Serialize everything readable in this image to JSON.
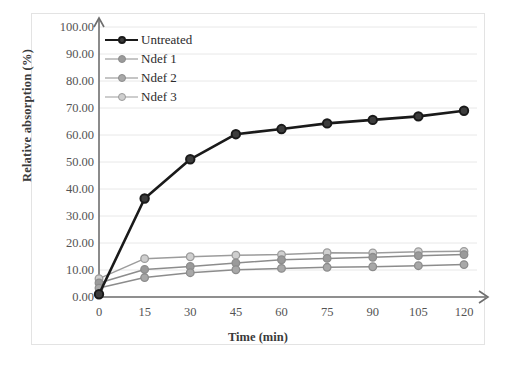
{
  "chart_data": {
    "type": "line",
    "title": "",
    "xlabel": "Time (min)",
    "ylabel": "Relative absorption (%)",
    "x": [
      0,
      15,
      30,
      45,
      60,
      75,
      90,
      105,
      120
    ],
    "xticklabels": [
      "0",
      "15",
      "30",
      "45",
      "60",
      "75",
      "90",
      "105",
      "120"
    ],
    "yticklabels": [
      "0.00",
      "10.00",
      "20.00",
      "30.00",
      "40.00",
      "50.00",
      "60.00",
      "70.00",
      "80.00",
      "90.00",
      "100.00"
    ],
    "yticks": [
      0,
      10,
      20,
      30,
      40,
      50,
      60,
      70,
      80,
      90,
      100
    ],
    "xlim": [
      0,
      120
    ],
    "ylim": [
      0,
      100
    ],
    "grid": "horizontal",
    "legend_position": "upper-left-inside",
    "series": [
      {
        "name": "Untreated",
        "color": "#1a1a1a",
        "marker": "circle",
        "marker_fill": "#3d3d3d",
        "linewidth": 2.6,
        "values": [
          1.0,
          36.5,
          51.0,
          60.3,
          62.2,
          64.3,
          65.6,
          66.9,
          69.0
        ]
      },
      {
        "name": "Ndef 1",
        "color": "#8c8c8c",
        "marker": "circle",
        "marker_fill": "#9a9a9a",
        "linewidth": 1.5,
        "values": [
          5.2,
          10.2,
          11.3,
          12.6,
          13.8,
          14.3,
          14.7,
          15.3,
          15.7
        ]
      },
      {
        "name": "Ndef 2",
        "color": "#8c8c8c",
        "marker": "circle",
        "marker_fill": "#a8a8a8",
        "linewidth": 1.5,
        "values": [
          3.3,
          7.2,
          9.0,
          10.1,
          10.6,
          11.0,
          11.2,
          11.6,
          12.0
        ]
      },
      {
        "name": "Ndef 3",
        "color": "#9c9c9c",
        "marker": "circle",
        "marker_fill": "#cfcfcf",
        "linewidth": 1.5,
        "values": [
          6.8,
          14.2,
          14.9,
          15.5,
          15.7,
          16.4,
          16.3,
          16.8,
          16.9
        ]
      }
    ]
  },
  "axes": {
    "x_arrow": true,
    "y_arrow": true,
    "axis_color": "#6e6e6e",
    "grid_color": "#e8e8e8",
    "frame_color": "#e3e3e3"
  }
}
